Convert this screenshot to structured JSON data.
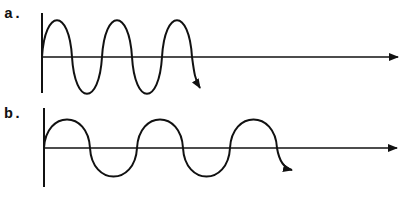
{
  "diagram": {
    "colors": {
      "ink": "#111111",
      "background": "#ffffff"
    },
    "panels": [
      {
        "label": "a.",
        "wave": {
          "amplitude_px": 37,
          "half_period_px": 30,
          "half_cycles": 5,
          "note": "shorter wavelength"
        }
      },
      {
        "label": "b.",
        "wave": {
          "amplitude_px": 28,
          "half_period_px": 46.5,
          "half_cycles": 5,
          "note": "longer wavelength"
        }
      }
    ]
  }
}
